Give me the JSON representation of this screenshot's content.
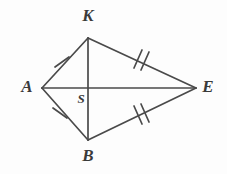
{
  "figure": {
    "kind": "geometry-diagram",
    "shape_name": "kite",
    "background_color": "#fdfdfd",
    "stroke_color": "#4a4a4a",
    "label_color": "#3a3a3a",
    "canvas": {
      "width": 227,
      "height": 174
    }
  },
  "vertices": [
    {
      "id": "K",
      "label": "K",
      "x": 88,
      "y": 38,
      "label_x": 88,
      "label_y": 17
    },
    {
      "id": "A",
      "label": "A",
      "x": 42,
      "y": 88,
      "label_x": 27,
      "label_y": 88
    },
    {
      "id": "E",
      "label": "E",
      "x": 196,
      "y": 88,
      "label_x": 208,
      "label_y": 88
    },
    {
      "id": "B",
      "label": "B",
      "x": 88,
      "y": 140,
      "label_x": 88,
      "label_y": 157
    },
    {
      "id": "S",
      "label": "S",
      "x": 88,
      "y": 88,
      "label_x": 81,
      "label_y": 100
    }
  ],
  "segments": [
    {
      "id": "AK",
      "from": "A",
      "to": "K",
      "tick_count": 1
    },
    {
      "id": "KE",
      "from": "K",
      "to": "E",
      "tick_count": 2
    },
    {
      "id": "AB",
      "from": "A",
      "to": "B",
      "tick_count": 1
    },
    {
      "id": "BE",
      "from": "B",
      "to": "E",
      "tick_count": 2
    },
    {
      "id": "AE",
      "from": "A",
      "to": "E",
      "tick_count": 0
    },
    {
      "id": "KB",
      "from": "K",
      "to": "B",
      "tick_count": 0
    }
  ],
  "tick_marks": [
    {
      "id": "tick-AK-1",
      "on_segment": "AK",
      "x": 62,
      "y": 62,
      "count": 1
    },
    {
      "id": "tick-AB-1",
      "on_segment": "AB",
      "x": 60,
      "y": 113,
      "count": 1
    },
    {
      "id": "tick-KE-2",
      "on_segment": "KE",
      "x": 141,
      "y": 59,
      "count": 2
    },
    {
      "id": "tick-BE-2",
      "on_segment": "BE",
      "x": 141,
      "y": 115,
      "count": 2
    }
  ]
}
